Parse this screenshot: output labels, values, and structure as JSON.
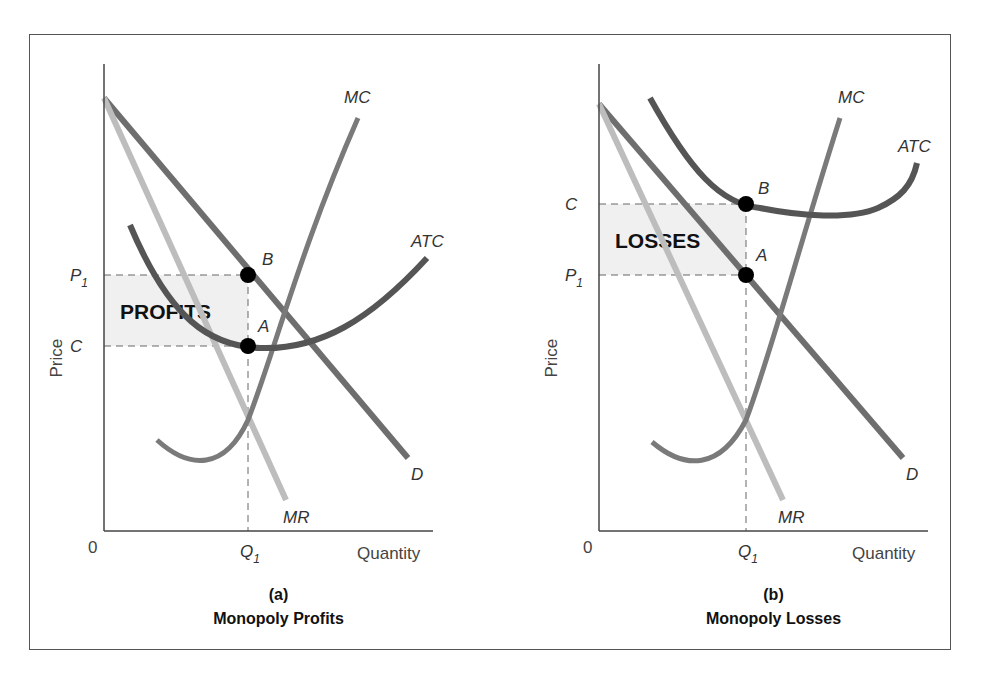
{
  "figure": {
    "frame_color": "#555555",
    "colors": {
      "demand": "#6e6e6e",
      "atc": "#555555",
      "mc": "#7a7a7a",
      "mr": "#bdbdbd",
      "shade": "#f0f0f0",
      "dashed": "#666666",
      "point": "#000000",
      "axis": "#444444"
    }
  },
  "chart_data": [
    {
      "type": "line",
      "panel_letter": "(a)",
      "title": "Monopoly Profits",
      "xlabel": "Quantity",
      "ylabel": "Price",
      "origin_label": "0",
      "x_ticks": [
        {
          "label": "Q",
          "sub": "1",
          "x": 248
        }
      ],
      "y_ticks": [
        {
          "label": "P",
          "sub": "1",
          "y": 275
        },
        {
          "label": "C",
          "sub": "",
          "y": 346
        }
      ],
      "shaded_region": {
        "label": "PROFITS",
        "x0": 104,
        "x1": 248,
        "y0": 275,
        "y1": 346
      },
      "points": [
        {
          "name": "B",
          "x": 248,
          "y": 275,
          "label_dx": 14,
          "label_dy": -10
        },
        {
          "name": "A",
          "x": 248,
          "y": 346,
          "label_dx": 10,
          "label_dy": -14
        }
      ],
      "axes": {
        "x0": 104,
        "y0": 531,
        "x_end": 433,
        "y_top": 64
      },
      "series": [
        {
          "name": "D",
          "kind": "demand",
          "path": "M104,98 L408,458",
          "label": "D",
          "lx": 411,
          "ly": 480
        },
        {
          "name": "MR",
          "kind": "mr",
          "path": "M104,98 L286,500",
          "label": "MR",
          "lx": 283,
          "ly": 523
        },
        {
          "name": "MC",
          "kind": "mc",
          "path": "M157,440 C190,470 225,470 248,420 C275,350 300,250 358,118",
          "label": "MC",
          "lx": 344,
          "ly": 103
        },
        {
          "name": "ATC",
          "kind": "atc",
          "path": "M130,225 C170,320 210,346 260,348 C320,350 370,320 427,258",
          "label": "ATC",
          "lx": 411,
          "ly": 247
        }
      ]
    },
    {
      "type": "line",
      "panel_letter": "(b)",
      "title": "Monopoly Losses",
      "xlabel": "Quantity",
      "ylabel": "Price",
      "origin_label": "0",
      "x_ticks": [
        {
          "label": "Q",
          "sub": "1",
          "x": 746
        }
      ],
      "y_ticks": [
        {
          "label": "C",
          "sub": "",
          "y": 204
        },
        {
          "label": "P",
          "sub": "1",
          "y": 275
        }
      ],
      "shaded_region": {
        "label": "LOSSES",
        "x0": 599,
        "x1": 746,
        "y0": 204,
        "y1": 275
      },
      "points": [
        {
          "name": "B",
          "x": 746,
          "y": 204,
          "label_dx": 12,
          "label_dy": -10
        },
        {
          "name": "A",
          "x": 746,
          "y": 275,
          "label_dx": 10,
          "label_dy": -14
        }
      ],
      "axes": {
        "x0": 599,
        "y0": 531,
        "x_end": 928,
        "y_top": 64
      },
      "series": [
        {
          "name": "D",
          "kind": "demand",
          "path": "M599,104 L903,458",
          "label": "D",
          "lx": 906,
          "ly": 480
        },
        {
          "name": "MR",
          "kind": "mr",
          "path": "M599,104 L783,500",
          "label": "MR",
          "lx": 778,
          "ly": 523
        },
        {
          "name": "MC",
          "kind": "mc",
          "path": "M652,442 C685,470 720,470 746,420 C772,350 798,250 840,118",
          "label": "MC",
          "lx": 838,
          "ly": 103
        },
        {
          "name": "ATC",
          "kind": "atc",
          "path": "M650,98 C690,170 720,204 760,208 C800,216 850,220 878,208 C900,198 912,186 917,163",
          "label": "ATC",
          "lx": 898,
          "ly": 152
        }
      ]
    }
  ]
}
